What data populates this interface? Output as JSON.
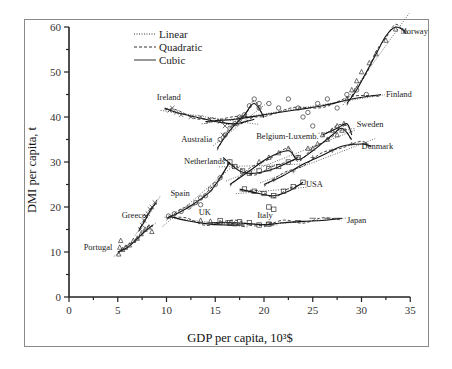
{
  "chart_data": {
    "type": "scatter",
    "title": "",
    "xlabel": "GDP per capita, 10³$",
    "ylabel": "DMI per capita, t",
    "xlim": [
      0,
      35
    ],
    "ylim": [
      0,
      60
    ],
    "x_ticks": [
      0,
      5,
      10,
      15,
      20,
      25,
      30,
      35
    ],
    "y_ticks": [
      0,
      10,
      20,
      30,
      40,
      50,
      60
    ],
    "grid": false,
    "legend_position": "top-left",
    "legend": [
      {
        "name": "Linear",
        "style": "dotted"
      },
      {
        "name": "Quadratic",
        "style": "dashed"
      },
      {
        "name": "Cubic",
        "style": "solid"
      }
    ],
    "series": [
      {
        "name": "Portugal",
        "marker": "triangle",
        "label_at": [
          1.5,
          10.5
        ],
        "points": [
          [
            5.1,
            9.5
          ],
          [
            5.2,
            11
          ],
          [
            5.3,
            12.5
          ],
          [
            5.5,
            10.5
          ],
          [
            5.8,
            11
          ],
          [
            6.2,
            11.5
          ],
          [
            6.6,
            12.5
          ],
          [
            7.0,
            13
          ],
          [
            7.4,
            14
          ],
          [
            7.8,
            15
          ],
          [
            8.2,
            15.5
          ],
          [
            8.5,
            14.5
          ]
        ],
        "cubic": [
          [
            5.0,
            10
          ],
          [
            6.0,
            11
          ],
          [
            7.0,
            13
          ],
          [
            8.0,
            15
          ],
          [
            8.6,
            16
          ]
        ]
      },
      {
        "name": "Greece",
        "marker": "x",
        "label_at": [
          5.4,
          17.5
        ],
        "points": [
          [
            7.3,
            15
          ],
          [
            7.5,
            16
          ],
          [
            7.7,
            17
          ],
          [
            7.9,
            18
          ],
          [
            8.1,
            18.5
          ],
          [
            8.3,
            19.5
          ],
          [
            8.5,
            20
          ],
          [
            8.8,
            21
          ]
        ],
        "cubic": [
          [
            7.2,
            15
          ],
          [
            7.8,
            17
          ],
          [
            8.4,
            19.5
          ],
          [
            9.0,
            21
          ]
        ]
      },
      {
        "name": "Spain",
        "marker": "circle",
        "label_at": [
          10.4,
          22.5
        ],
        "points": [
          [
            10.2,
            18
          ],
          [
            10.8,
            18.5
          ],
          [
            11.5,
            19
          ],
          [
            12.3,
            20
          ],
          [
            13.0,
            21
          ],
          [
            13.5,
            22
          ],
          [
            14.0,
            22.5
          ],
          [
            14.5,
            24
          ],
          [
            15.0,
            25
          ],
          [
            15.5,
            26.5
          ],
          [
            13.5,
            20.5
          ]
        ],
        "cubic": [
          [
            10.0,
            17.5
          ],
          [
            11.5,
            19
          ],
          [
            13.0,
            21
          ],
          [
            14.5,
            23.5
          ],
          [
            15.5,
            26.5
          ],
          [
            16.5,
            30
          ]
        ]
      },
      {
        "name": "UK",
        "marker": "triangle",
        "label_at": [
          13.3,
          18.3
        ],
        "points": [
          [
            13.5,
            17
          ],
          [
            14.5,
            16.8
          ],
          [
            15.5,
            16.5
          ],
          [
            16.5,
            16.3
          ],
          [
            17.0,
            16.2
          ]
        ],
        "cubic": [
          [
            10.2,
            18
          ],
          [
            12,
            17
          ],
          [
            14,
            16.3
          ],
          [
            16,
            16
          ],
          [
            18,
            16
          ]
        ]
      },
      {
        "name": "Italy",
        "marker": "square",
        "label_at": [
          19.3,
          17.5
        ],
        "points": [
          [
            15.5,
            17
          ],
          [
            16.5,
            16.5
          ],
          [
            17.5,
            16.7
          ],
          [
            18.5,
            16.5
          ],
          [
            19.5,
            16
          ],
          [
            20.5,
            16.2
          ]
        ],
        "cubic": [
          [
            14.5,
            16.5
          ],
          [
            17,
            16.5
          ],
          [
            19,
            16.2
          ],
          [
            21,
            16
          ]
        ]
      },
      {
        "name": "Japan",
        "marker": "minus",
        "label_at": [
          28.5,
          16.5
        ],
        "points": [
          [
            20.5,
            16.5
          ],
          [
            22,
            16.5
          ],
          [
            23.5,
            17
          ],
          [
            25,
            17.5
          ],
          [
            26.5,
            17.5
          ],
          [
            27.5,
            17.5
          ]
        ],
        "cubic": [
          [
            20,
            16
          ],
          [
            22,
            16.5
          ],
          [
            24,
            16.8
          ],
          [
            26,
            17
          ],
          [
            28,
            17.5
          ]
        ]
      },
      {
        "name": "USA",
        "marker": "square",
        "label_at": [
          24.3,
          24.5
        ],
        "points": [
          [
            18.0,
            24
          ],
          [
            19.0,
            23.5
          ],
          [
            20.0,
            23
          ],
          [
            21.0,
            22.5
          ],
          [
            22.0,
            23.5
          ],
          [
            23.0,
            24.5
          ],
          [
            24.0,
            25.5
          ],
          [
            20.5,
            20
          ],
          [
            21,
            19.5
          ]
        ],
        "cubic": [
          [
            17.5,
            24
          ],
          [
            19.5,
            23
          ],
          [
            21,
            22.5
          ],
          [
            22.5,
            23.5
          ],
          [
            24,
            25.5
          ]
        ]
      },
      {
        "name": "Netherlands",
        "marker": "square",
        "label_at": [
          11.8,
          29.5
        ],
        "points": [
          [
            16.5,
            30
          ],
          [
            17.0,
            29
          ],
          [
            17.8,
            28
          ],
          [
            18.5,
            27.5
          ],
          [
            19.5,
            28
          ],
          [
            20.5,
            28.5
          ],
          [
            21.5,
            29
          ],
          [
            22.5,
            30
          ],
          [
            23.5,
            31
          ]
        ],
        "cubic": [
          [
            15.8,
            31
          ],
          [
            17.5,
            28
          ],
          [
            19,
            27.5
          ],
          [
            21,
            28.5
          ],
          [
            23.5,
            31
          ]
        ]
      },
      {
        "name": "Belgium-Luxemb.",
        "marker": "triangle",
        "label_at": [
          19.2,
          35.2
        ],
        "points": [
          [
            19.5,
            30
          ],
          [
            20.5,
            31
          ],
          [
            21.5,
            32
          ],
          [
            22.5,
            33
          ],
          [
            23.5,
            31
          ],
          [
            24.5,
            33
          ],
          [
            25.5,
            34
          ],
          [
            26.5,
            35
          ],
          [
            27.5,
            36
          ],
          [
            28.0,
            37
          ],
          [
            26.0,
            36
          ],
          [
            25.0,
            33
          ]
        ],
        "cubic": [
          [
            16.5,
            25
          ],
          [
            18.5,
            28
          ],
          [
            20.5,
            31
          ],
          [
            22.5,
            32.5
          ],
          [
            23.5,
            30.5
          ],
          [
            25,
            32.5
          ],
          [
            27,
            36
          ],
          [
            28,
            37.5
          ],
          [
            29,
            35
          ]
        ]
      },
      {
        "name": "Sweden",
        "marker": "triangle",
        "label_at": [
          29.5,
          37.8
        ],
        "points": [
          [
            27.0,
            37
          ],
          [
            27.5,
            38
          ],
          [
            28.2,
            38.5
          ]
        ],
        "cubic": [
          [
            26,
            36
          ],
          [
            27.5,
            37.5
          ],
          [
            28.5,
            38.5
          ],
          [
            29,
            36
          ]
        ]
      },
      {
        "name": "Denmark",
        "marker": "plus",
        "label_at": [
          30.0,
          32.8
        ],
        "points": [
          [
            21.0,
            26
          ],
          [
            23.0,
            28
          ],
          [
            25.0,
            31
          ],
          [
            27.0,
            32.5
          ],
          [
            29.0,
            34
          ],
          [
            30.5,
            34
          ]
        ],
        "cubic": [
          [
            20,
            25
          ],
          [
            22,
            27
          ],
          [
            24,
            29.5
          ],
          [
            26,
            31.5
          ],
          [
            28,
            33.5
          ],
          [
            30,
            34
          ],
          [
            31,
            33.5
          ]
        ]
      },
      {
        "name": "Australia",
        "marker": "circle",
        "label_at": [
          11.5,
          34.5
        ],
        "points": [
          [
            15.5,
            35
          ],
          [
            16.0,
            36
          ],
          [
            16.5,
            37.5
          ],
          [
            17.0,
            38.5
          ],
          [
            17.5,
            39.5
          ],
          [
            18.0,
            40.5
          ],
          [
            18.5,
            42.5
          ],
          [
            19.0,
            44
          ],
          [
            19.5,
            43
          ]
        ],
        "cubic": [
          [
            15.2,
            33
          ],
          [
            16.5,
            37
          ],
          [
            18,
            40.5
          ],
          [
            19,
            43
          ],
          [
            20,
            40
          ]
        ]
      },
      {
        "name": "Ireland",
        "marker": "x",
        "label_at": [
          9.0,
          43.8
        ],
        "points": [
          [
            10.3,
            41.5
          ],
          [
            10.6,
            42
          ],
          [
            11.0,
            41
          ],
          [
            11.5,
            40.5
          ],
          [
            12.5,
            40
          ],
          [
            13.5,
            40
          ],
          [
            14.5,
            39.5
          ],
          [
            15.5,
            39
          ],
          [
            16.0,
            38
          ],
          [
            15.8,
            36
          ]
        ],
        "cubic": [
          [
            9.8,
            42
          ],
          [
            11,
            41
          ],
          [
            13,
            40
          ],
          [
            15,
            39
          ],
          [
            17,
            38.5
          ],
          [
            19,
            39.5
          ]
        ]
      },
      {
        "name": "Finland",
        "marker": "circle",
        "label_at": [
          32.5,
          44.5
        ],
        "points": [
          [
            17.5,
            40
          ],
          [
            19.5,
            42
          ],
          [
            20.5,
            43
          ],
          [
            21.5,
            42
          ],
          [
            22.5,
            44
          ],
          [
            23.5,
            42
          ],
          [
            24.5,
            41
          ],
          [
            25.5,
            43
          ],
          [
            26.5,
            44
          ],
          [
            27.5,
            42
          ],
          [
            28.5,
            45
          ],
          [
            29.5,
            46
          ],
          [
            30.5,
            45
          ],
          [
            24,
            40
          ],
          [
            25,
            38
          ]
        ],
        "cubic": [
          [
            14,
            39
          ],
          [
            17,
            39.5
          ],
          [
            20,
            40.5
          ],
          [
            23,
            41.5
          ],
          [
            26,
            42.5
          ],
          [
            29,
            44
          ],
          [
            32,
            45
          ]
        ]
      },
      {
        "name": "Norway",
        "marker": "triangle",
        "label_at": [
          34.0,
          58.5
        ],
        "points": [
          [
            28.5,
            44
          ],
          [
            29.0,
            46
          ],
          [
            29.5,
            48
          ],
          [
            30.0,
            50
          ],
          [
            30.8,
            52
          ],
          [
            31.5,
            54
          ],
          [
            32.5,
            57
          ],
          [
            33.5,
            59.5
          ],
          [
            34.5,
            59
          ]
        ],
        "cubic": [
          [
            28.5,
            43
          ],
          [
            29.5,
            46
          ],
          [
            30.5,
            50
          ],
          [
            31.5,
            54
          ],
          [
            32.5,
            58
          ],
          [
            33.5,
            60
          ],
          [
            34.5,
            59
          ]
        ]
      }
    ]
  }
}
